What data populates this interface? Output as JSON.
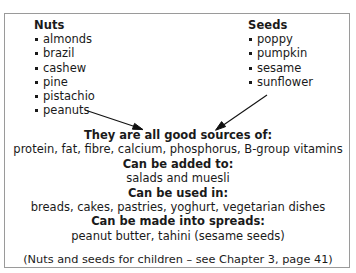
{
  "figure": {
    "border_color": "#9a9a9a",
    "text_color": "#1a1a1a",
    "background_color": "#ffffff"
  },
  "columns": [
    {
      "heading": "Nuts",
      "items": [
        "almonds",
        "brazil",
        "cashew",
        "pine",
        "pistachio",
        "peanuts"
      ]
    },
    {
      "heading": "Seeds",
      "items": [
        "poppy",
        "pumpkin",
        "sesame",
        "sunflower"
      ]
    }
  ],
  "arrows": [
    {
      "name": "nuts-to-summary-arrow",
      "from_x": 80,
      "to_x": 137,
      "direction": "down-right"
    },
    {
      "name": "seeds-to-summary-arrow",
      "from_x": 262,
      "to_x": 212,
      "direction": "down-left"
    }
  ],
  "summary": {
    "sections": [
      {
        "heading": "They are all good sources of:",
        "content": "protein, fat, fibre, calcium, phosphorus, B-group vitamins"
      },
      {
        "heading": "Can be added to:",
        "content": "salads and muesli"
      },
      {
        "heading": "Can be used in:",
        "content": "breads, cakes, pastries, yoghurt, vegetarian dishes"
      },
      {
        "heading": "Can be made into spreads:",
        "content": "peanut butter, tahini (sesame seeds)"
      }
    ],
    "credit": "(Nuts and seeds for children – see Chapter 3, page 41)"
  }
}
